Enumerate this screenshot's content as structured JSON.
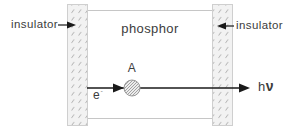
{
  "diagram": {
    "labels": {
      "insulator_left": "insulator",
      "insulator_right": "insulator",
      "phosphor": "phosphor",
      "site": "A",
      "electron": "e",
      "electron_superscript": "-",
      "photon_h": "h",
      "photon_nu": "ν"
    },
    "colors": {
      "background": "#ffffff",
      "box_border": "#c6c6c6",
      "strip_fill": "#f2f2f2",
      "strip_border": "#cfcfcf",
      "hatch_mark": "#a8a8a8",
      "arrow": "#1a1a1a",
      "text": "#3c3c3c",
      "site_fill": "#ececec",
      "site_hatch": "#8f8f8f",
      "site_outline": "#9a9a9a"
    }
  }
}
